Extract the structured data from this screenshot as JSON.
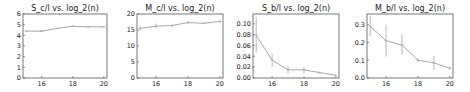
{
  "chart_data": [
    {
      "type": "line",
      "title": "S_c/l vs. log_2(n)",
      "xlabel": "",
      "ylabel": "",
      "x": [
        15,
        16,
        17,
        18,
        19,
        20
      ],
      "series": [
        {
          "name": "S_c/l",
          "values": [
            4.4,
            4.4,
            4.65,
            4.85,
            4.8,
            4.8
          ],
          "err_low": [
            4.3,
            4.3,
            4.6,
            4.8,
            4.75,
            4.75
          ],
          "err_high": [
            4.5,
            4.5,
            4.7,
            4.9,
            4.85,
            4.85
          ]
        }
      ],
      "xticks": [
        16,
        18,
        20
      ],
      "xlim": [
        14.8,
        20.2
      ],
      "yticks": [
        0,
        1,
        2,
        3,
        4,
        5,
        6
      ],
      "ytick_labels": [
        "0",
        "1",
        "2",
        "3",
        "4",
        "5",
        "6"
      ],
      "ylim": [
        0,
        6
      ],
      "grid": false,
      "legend": null
    },
    {
      "type": "line",
      "title": "M_c/l vs. log_2(n)",
      "xlabel": "",
      "ylabel": "",
      "x": [
        15,
        16,
        17,
        18,
        19,
        20
      ],
      "series": [
        {
          "name": "M_c/l",
          "values": [
            15.5,
            16.2,
            16.4,
            17.3,
            17.1,
            17.7
          ],
          "err_low": [
            14.8,
            15.4,
            16.0,
            16.8,
            16.9,
            17.2
          ],
          "err_high": [
            16.2,
            17.0,
            16.8,
            17.8,
            17.3,
            18.2
          ]
        }
      ],
      "xticks": [
        16,
        18,
        20
      ],
      "xlim": [
        14.8,
        20.2
      ],
      "yticks": [
        0,
        5,
        10,
        15,
        20
      ],
      "ytick_labels": [
        "0",
        "5",
        "10",
        "15",
        "20"
      ],
      "ylim": [
        0,
        20
      ],
      "grid": false,
      "legend": null
    },
    {
      "type": "line",
      "title": "S_b/l vs. log_2(n)",
      "xlabel": "",
      "ylabel": "",
      "x": [
        15,
        16,
        17,
        18,
        19,
        20
      ],
      "series": [
        {
          "name": "S_b/l",
          "values": [
            0.079,
            0.033,
            0.015,
            0.015,
            0.01,
            0.005
          ],
          "err_low": [
            0.048,
            0.02,
            0.008,
            0.008,
            0.008,
            0.004
          ],
          "err_high": [
            0.112,
            0.045,
            0.022,
            0.021,
            0.012,
            0.006
          ]
        }
      ],
      "xticks": [
        16,
        18,
        20
      ],
      "xlim": [
        14.8,
        20.2
      ],
      "yticks": [
        0.0,
        0.02,
        0.04,
        0.06,
        0.08,
        0.1
      ],
      "ytick_labels": [
        "0.00",
        "0.02",
        "0.04",
        "0.06",
        "0.08",
        "0.10"
      ],
      "ylim": [
        0,
        0.118
      ],
      "grid": false,
      "legend": null
    },
    {
      "type": "line",
      "title": "M_b/l vs. log_2(n)",
      "xlabel": "",
      "ylabel": "",
      "x": [
        15,
        16,
        17,
        18,
        19,
        20
      ],
      "series": [
        {
          "name": "M_b/l",
          "values": [
            0.29,
            0.21,
            0.185,
            0.1,
            0.085,
            0.055
          ],
          "err_low": [
            0.235,
            0.12,
            0.13,
            0.09,
            0.045,
            0.045
          ],
          "err_high": [
            0.35,
            0.3,
            0.245,
            0.11,
            0.125,
            0.065
          ]
        }
      ],
      "xticks": [
        16,
        18,
        20
      ],
      "xlim": [
        14.8,
        20.2
      ],
      "yticks": [
        0.0,
        0.1,
        0.2,
        0.3
      ],
      "ytick_labels": [
        "0.0",
        "0.1",
        "0.2",
        "0.3"
      ],
      "ylim": [
        0,
        0.36
      ],
      "grid": false,
      "legend": null
    }
  ],
  "colors": {
    "line": "#a8a8a8",
    "spine": "#555555",
    "text": "#222222"
  }
}
